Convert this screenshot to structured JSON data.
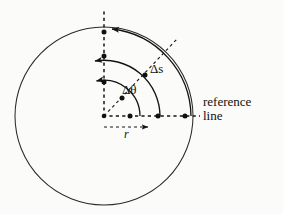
{
  "figure": {
    "background_color": "#fbfbfa",
    "stroke_color": "#1a1a1a",
    "labels": {
      "reference_line_1": "reference",
      "reference_line_2": "line",
      "delta_s": "Δs",
      "delta_theta": "Δθ",
      "radius": "r"
    },
    "geometry": {
      "circle": {
        "cx": 104,
        "cy": 116,
        "r": 89
      },
      "center_point": {
        "x": 104,
        "y": 116
      },
      "reference_line_y": 116,
      "vertical_axis_x": 104,
      "diagonal_ray_angle_deg": 45,
      "points_on_reference_line": [
        {
          "x": 130,
          "y": 116,
          "name": "point-near-center"
        },
        {
          "x": 158,
          "y": 116,
          "name": "point-mid"
        },
        {
          "x": 185,
          "y": 116,
          "name": "point-on-circle"
        }
      ],
      "points_on_vertical_axis": [
        {
          "x": 104,
          "y": 82,
          "name": "point-upper-near"
        },
        {
          "x": 104,
          "y": 56,
          "name": "point-upper-mid"
        },
        {
          "x": 104,
          "y": 32,
          "name": "point-top-of-circle"
        }
      ],
      "points_on_diagonal": [
        {
          "x": 122,
          "y": 98,
          "name": "diag-point-near"
        },
        {
          "x": 145,
          "y": 75,
          "name": "diag-point-on-arc"
        }
      ],
      "arcs": [
        {
          "name": "arc-delta-theta",
          "radius": 36,
          "from_deg": 0,
          "to_deg": 102
        },
        {
          "name": "arc-delta-s-inner",
          "radius": 56,
          "from_deg": 0,
          "to_deg": 103
        },
        {
          "name": "arc-delta-s-outer",
          "radius": 89,
          "from_deg": 0,
          "to_deg": 95
        }
      ]
    }
  }
}
